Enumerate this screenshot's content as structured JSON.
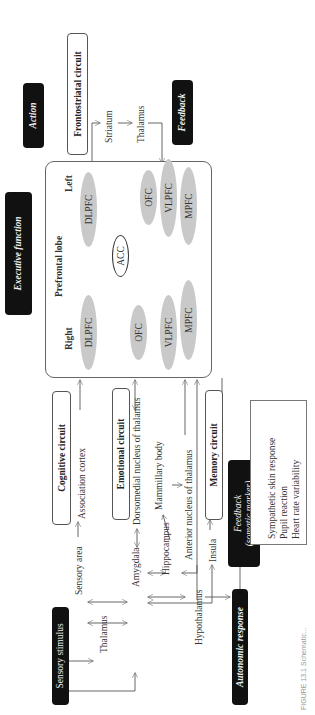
{
  "diagram": {
    "orientation": "rotated-90-ccw",
    "top_badges": {
      "executive_function": "Executive function",
      "action": "Action",
      "feedback": "Feedback"
    },
    "frontostriatal": {
      "title": "Frontostriatal circuit",
      "nodes": [
        "Striatum",
        "Thalamus"
      ]
    },
    "prefrontal_lobe": {
      "title": "Prefrontal lobe",
      "hemispheres": {
        "right": {
          "label": "Right",
          "regions": [
            "DLPFC",
            "OFC",
            "VLPFC",
            "MPFC"
          ]
        },
        "left": {
          "label": "Left",
          "regions": [
            "DLPFC",
            "OFC",
            "VLPFC",
            "MPFC"
          ]
        }
      },
      "center": "ACC"
    },
    "circuits": {
      "cognitive": "Cognitive circuit",
      "emotional": "Emotional circuit",
      "memory": "Memory circuit"
    },
    "nodes": {
      "sensory_stimulus": "Sensory stimulus",
      "sensory_area": "Sensory area",
      "thalamus": "Thalamus",
      "amygdala": "Amygdala",
      "association_cortex": "Association   cortex",
      "dorsomedial": "Dorsomedial nucleus of thalamus",
      "hippocampus": "Hippocampus",
      "mammillary": "Mammillary   body",
      "anterior_nucleus": "Anterior nucleus of thalamus",
      "insula": "Insula",
      "hypothalamus": "Hypothalamus",
      "autonomic_response": "Autonomic response"
    },
    "somatic_feedback": {
      "line1": "Feedback",
      "line2": "(somatic marker)",
      "measures": [
        "Sympathetic skin response",
        "Pupil reaction",
        "Heart rate variability"
      ]
    },
    "caption": "FIGURE 13.1  Schematic..."
  }
}
